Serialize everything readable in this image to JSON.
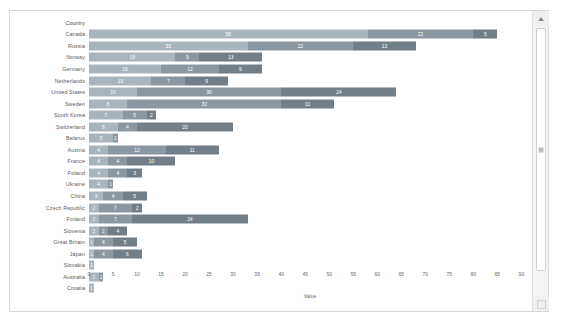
{
  "chart_data": {
    "type": "bar",
    "orientation": "horizontal",
    "stacked": true,
    "title": "",
    "xlabel": "Value",
    "ylabel": "Country",
    "xlim": [
      0,
      92
    ],
    "xticks": [
      0,
      5,
      10,
      15,
      20,
      25,
      30,
      35,
      40,
      45,
      50,
      55,
      60,
      65,
      70,
      75,
      80,
      85,
      90
    ],
    "grid": false,
    "legend": "none",
    "categories": [
      "Canada",
      "Russia",
      "Norway",
      "Germany",
      "Netherlands",
      "United States",
      "Sweden",
      "South Korea",
      "Switzerland",
      "Belarus",
      "Austria",
      "France",
      "Poland",
      "Ukraine",
      "China",
      "Czech Republic",
      "Finland",
      "Slovenia",
      "Great Britain",
      "Japan",
      "Slovakia",
      "Australia",
      "Croatia"
    ],
    "rows": [
      {
        "label": "Canada",
        "values": [
          58,
          22,
          5
        ]
      },
      {
        "label": "Russia",
        "values": [
          33,
          22,
          13
        ]
      },
      {
        "label": "Norway",
        "values": [
          18,
          5,
          13
        ]
      },
      {
        "label": "Germany",
        "values": [
          15,
          12,
          9
        ]
      },
      {
        "label": "Netherlands",
        "values": [
          13,
          7,
          9
        ]
      },
      {
        "label": "United States",
        "values": [
          10,
          30,
          24
        ]
      },
      {
        "label": "Sweden",
        "values": [
          8,
          32,
          11
        ]
      },
      {
        "label": "South Korea",
        "values": [
          7,
          5,
          2
        ]
      },
      {
        "label": "Switzerland",
        "values": [
          6,
          4,
          20
        ]
      },
      {
        "label": "Belarus",
        "values": [
          5,
          1
        ]
      },
      {
        "label": "Austria",
        "values": [
          4,
          12,
          11
        ]
      },
      {
        "label": "France",
        "values": [
          4,
          4,
          10
        ]
      },
      {
        "label": "Poland",
        "values": [
          4,
          4,
          3
        ]
      },
      {
        "label": "Ukraine",
        "values": [
          4,
          1
        ]
      },
      {
        "label": "China",
        "values": [
          3,
          4,
          5
        ]
      },
      {
        "label": "Czech Republic",
        "values": [
          2,
          7,
          2
        ]
      },
      {
        "label": "Finland",
        "values": [
          2,
          7,
          24
        ]
      },
      {
        "label": "Slovenia",
        "values": [
          2,
          2,
          4
        ]
      },
      {
        "label": "Great Britain",
        "values": [
          1,
          4,
          5
        ]
      },
      {
        "label": "Japan",
        "values": [
          1,
          4,
          6
        ]
      },
      {
        "label": "Slovakia",
        "values": [
          1
        ]
      },
      {
        "label": "Australia",
        "values": [
          2,
          1
        ]
      },
      {
        "label": "Croatia",
        "values": [
          1
        ]
      }
    ],
    "series_colors": [
      "#a9b5bd",
      "#8b98a1",
      "#727f89",
      "#5d6a74"
    ]
  },
  "header": {
    "country_header": "Country"
  },
  "scrollbar": {
    "up_arrow": "scroll-up",
    "down_arrow": "scroll-down"
  }
}
